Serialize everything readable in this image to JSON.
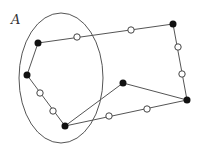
{
  "diagram": {
    "label": "A",
    "colors": {
      "line": "#555555",
      "filled_node": "#111111",
      "open_node_fill": "#ffffff",
      "open_node_stroke": "#444444"
    },
    "ellipse": {
      "cx": 61,
      "cy": 78,
      "rx": 42,
      "ry": 65
    },
    "filled_nodes": [
      {
        "id": "P1",
        "x": 38,
        "y": 43
      },
      {
        "id": "P2",
        "x": 27,
        "y": 75
      },
      {
        "id": "P3",
        "x": 65,
        "y": 126
      },
      {
        "id": "P4",
        "x": 173,
        "y": 24
      },
      {
        "id": "P5",
        "x": 123,
        "y": 83
      },
      {
        "id": "P6",
        "x": 187,
        "y": 100
      }
    ],
    "open_nodes": [
      {
        "x": 77,
        "y": 37
      },
      {
        "x": 131,
        "y": 30
      },
      {
        "x": 178,
        "y": 47
      },
      {
        "x": 182,
        "y": 74
      },
      {
        "x": 40,
        "y": 93
      },
      {
        "x": 53,
        "y": 111
      },
      {
        "x": 109,
        "y": 116
      },
      {
        "x": 147,
        "y": 109
      }
    ],
    "edges": [
      [
        "P1",
        "P4"
      ],
      [
        "P4",
        "P6"
      ],
      [
        "P6",
        "P5"
      ],
      [
        "P5",
        "P3"
      ],
      [
        "P3",
        "P6"
      ],
      [
        "P3",
        "P2"
      ],
      [
        "P2",
        "P1"
      ]
    ]
  }
}
